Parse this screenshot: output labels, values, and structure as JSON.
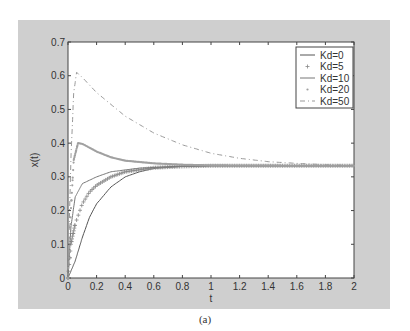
{
  "caption": "(a)",
  "chart_data": {
    "type": "line",
    "title": "",
    "xlabel": "t",
    "ylabel": "x(t)",
    "xlim": [
      0,
      2
    ],
    "ylim": [
      0,
      0.7
    ],
    "grid": false,
    "legend_position": "upper right",
    "x_ticks": [
      "0",
      "0.2",
      "0.4",
      "0.6",
      "0.8",
      "1",
      "1.2",
      "1.4",
      "1.6",
      "1.8",
      "2"
    ],
    "y_ticks": [
      "0",
      "0.1",
      "0.2",
      "0.3",
      "0.4",
      "0.5",
      "0.6",
      "0.7"
    ],
    "series": [
      {
        "name": "Kd=0",
        "style": "solid",
        "color": "#555555",
        "x": [
          0,
          0.05,
          0.1,
          0.15,
          0.2,
          0.3,
          0.4,
          0.5,
          0.6,
          0.8,
          1.0,
          1.5,
          2.0
        ],
        "y": [
          0,
          0.05,
          0.12,
          0.18,
          0.22,
          0.27,
          0.3,
          0.315,
          0.325,
          0.331,
          0.333,
          0.333,
          0.333
        ]
      },
      {
        "name": "Kd=5",
        "style": "plus-markers",
        "color": "#888888",
        "x": [
          0,
          0.02,
          0.05,
          0.1,
          0.15,
          0.2,
          0.3,
          0.4,
          0.6,
          0.8,
          1.0,
          1.5,
          2.0
        ],
        "y": [
          0,
          0.1,
          0.16,
          0.22,
          0.255,
          0.275,
          0.3,
          0.315,
          0.327,
          0.331,
          0.333,
          0.333,
          0.333
        ]
      },
      {
        "name": "Kd=10",
        "style": "solid",
        "color": "#777777",
        "x": [
          0,
          0.02,
          0.05,
          0.1,
          0.2,
          0.3,
          0.5,
          0.8,
          1.0,
          1.5,
          2.0
        ],
        "y": [
          0,
          0.15,
          0.24,
          0.28,
          0.3,
          0.315,
          0.326,
          0.332,
          0.333,
          0.333,
          0.333
        ]
      },
      {
        "name": "Kd=20",
        "style": "dots",
        "color": "#a0a0a0",
        "x": [
          0,
          0.02,
          0.04,
          0.07,
          0.1,
          0.2,
          0.3,
          0.4,
          0.6,
          0.8,
          1.0,
          1.5,
          2.0
        ],
        "y": [
          0,
          0.2,
          0.35,
          0.4,
          0.398,
          0.375,
          0.358,
          0.348,
          0.34,
          0.336,
          0.334,
          0.333,
          0.333
        ]
      },
      {
        "name": "Kd=50",
        "style": "dash-dot",
        "color": "#999999",
        "x": [
          0,
          0.02,
          0.04,
          0.06,
          0.1,
          0.2,
          0.4,
          0.6,
          0.8,
          1.0,
          1.2,
          1.4,
          1.6,
          1.8,
          2.0
        ],
        "y": [
          0,
          0.35,
          0.55,
          0.61,
          0.595,
          0.55,
          0.48,
          0.43,
          0.395,
          0.37,
          0.355,
          0.345,
          0.34,
          0.336,
          0.334
        ]
      }
    ]
  }
}
